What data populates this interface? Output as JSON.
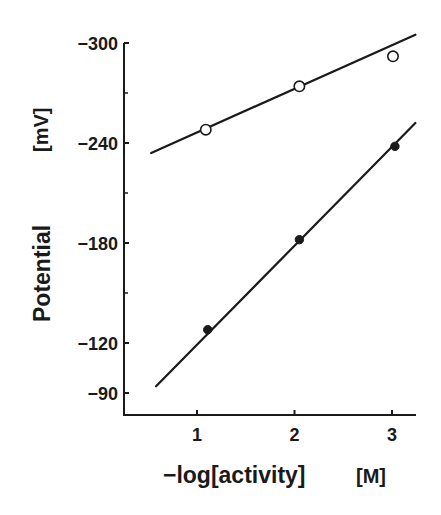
{
  "chart_data": {
    "type": "line",
    "title": "",
    "xlabel": "-log[activity]",
    "xlabel_unit": "[M]",
    "ylabel": "Potential",
    "ylabel_unit": "[mV]",
    "xlim": [
      0.25,
      3.24
    ],
    "ylim": [
      -76,
      -306
    ],
    "y_axis_inverted_note": "more negative potential plotted upward",
    "x_ticks": [
      1,
      2,
      3
    ],
    "x_tick_labels": [
      "1",
      "2",
      "3"
    ],
    "y_ticks": [
      -300,
      -240,
      -180,
      -120,
      -90
    ],
    "y_tick_labels": [
      "-300",
      "-240",
      "-180",
      "-120",
      "-90"
    ],
    "y_minor_ticks": [
      -270,
      -210,
      -150
    ],
    "grid": false,
    "legend": null,
    "series": [
      {
        "name": "open circles",
        "marker": "open-circle",
        "points": [
          {
            "x": 1.09,
            "y": -248
          },
          {
            "x": 2.05,
            "y": -274
          },
          {
            "x": 3.01,
            "y": -292
          }
        ],
        "fit_line": {
          "x_start": 0.53,
          "y_start": -234,
          "x_end": 3.24,
          "y_end": -305
        }
      },
      {
        "name": "filled circles",
        "marker": "filled-circle",
        "points": [
          {
            "x": 1.11,
            "y": -128
          },
          {
            "x": 2.05,
            "y": -182
          },
          {
            "x": 3.03,
            "y": -238
          }
        ],
        "fit_line": {
          "x_start": 0.58,
          "y_start": -94,
          "x_end": 3.24,
          "y_end": -252
        }
      }
    ]
  }
}
